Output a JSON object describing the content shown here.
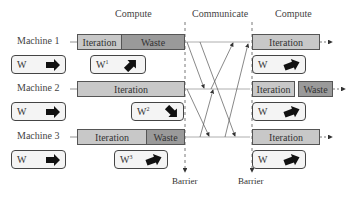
{
  "headers": {
    "compute_left": "Compute",
    "communicate": "Communicate",
    "compute_right": "Compute"
  },
  "machines": [
    {
      "label": "Machine 1",
      "local_weights": {
        "label": "W",
        "superscript": "",
        "arrow": "right"
      },
      "phase1": {
        "iteration": "Iteration",
        "waste": "Waste"
      },
      "phase1_weights": {
        "label": "W",
        "superscript": "1",
        "arrow": "up-right"
      },
      "phase2": {
        "iteration": "Iteration",
        "waste": ""
      },
      "phase2_weights": {
        "label": "W",
        "superscript": "",
        "arrow": "right"
      }
    },
    {
      "label": "Machine 2",
      "local_weights": {
        "label": "W",
        "superscript": "",
        "arrow": "right"
      },
      "phase1": {
        "iteration": "Iteration",
        "waste": ""
      },
      "phase1_weights": {
        "label": "W",
        "superscript": "2",
        "arrow": "down-right"
      },
      "phase2": {
        "iteration": "Iteration",
        "waste": "Waste"
      },
      "phase2_weights": {
        "label": "W",
        "superscript": "",
        "arrow": "right"
      }
    },
    {
      "label": "Machine 3",
      "local_weights": {
        "label": "W",
        "superscript": "",
        "arrow": "right"
      },
      "phase1": {
        "iteration": "Iteration",
        "waste": "Waste"
      },
      "phase1_weights": {
        "label": "W",
        "superscript": "3",
        "arrow": "right"
      },
      "phase2": {
        "iteration": "Iteration",
        "waste": ""
      },
      "phase2_weights": {
        "label": "W",
        "superscript": "",
        "arrow": "right"
      }
    }
  ],
  "barriers": [
    "Barrier",
    "Barrier"
  ],
  "colors": {
    "iteration": "#c8c8c8",
    "waste": "#9a9a9a",
    "weights_box": "#f4f4f4",
    "border": "#555555"
  }
}
